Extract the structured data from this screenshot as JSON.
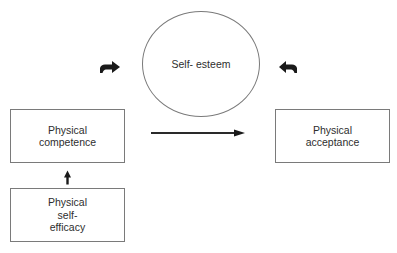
{
  "diagram": {
    "type": "conceptual-model",
    "top_caption_cropped": "",
    "nodes": {
      "self_esteem": {
        "shape": "circle",
        "lines": [
          "Self-",
          "esteem"
        ]
      },
      "physical_competence": {
        "shape": "rectangle",
        "lines": [
          "Physical",
          "competence"
        ]
      },
      "physical_acceptance": {
        "shape": "rectangle",
        "lines": [
          "Physical",
          "acceptance"
        ]
      },
      "physical_self_efficacy": {
        "shape": "rectangle",
        "lines": [
          "Physical",
          "self-",
          "efficacy"
        ]
      }
    },
    "edges": [
      {
        "from": "physical_self_efficacy",
        "to": "physical_competence",
        "style": "short-thick-arrow",
        "direction": "up"
      },
      {
        "from": "physical_competence",
        "to": "physical_acceptance",
        "style": "long-arrow",
        "direction": "right"
      },
      {
        "from": "physical_competence",
        "to": "self_esteem",
        "style": "short-thick-bent-arrow",
        "direction": "right"
      },
      {
        "from": "physical_acceptance",
        "to": "self_esteem",
        "style": "short-thick-bent-arrow",
        "direction": "left"
      }
    ],
    "colors": {
      "border": "#7a7a7a",
      "text": "#2e2e2e",
      "arrow": "#1a1a1a",
      "background": "#ffffff"
    }
  }
}
